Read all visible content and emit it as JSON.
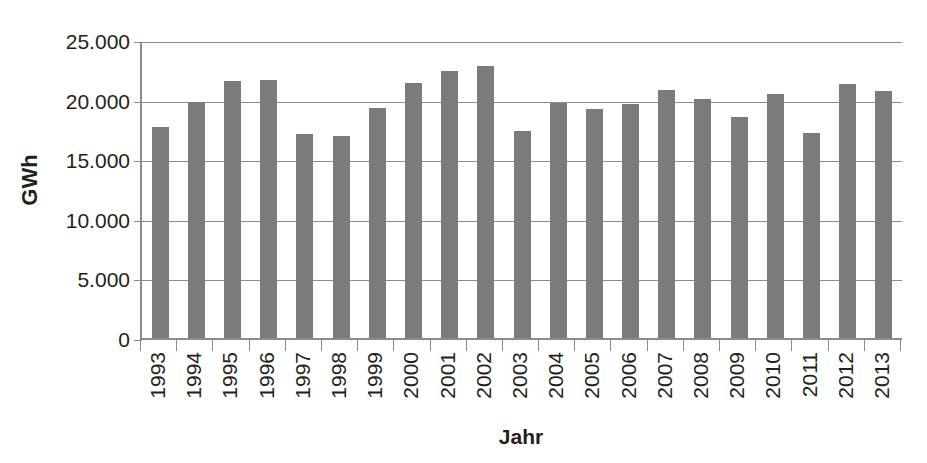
{
  "chart_data": {
    "type": "bar",
    "title": "",
    "subtitle": "",
    "xlabel": "Jahr",
    "ylabel": "GWh",
    "categories": [
      "1993",
      "1994",
      "1995",
      "1996",
      "1997",
      "1998",
      "1999",
      "2000",
      "2001",
      "2002",
      "2003",
      "2004",
      "2005",
      "2006",
      "2007",
      "2008",
      "2009",
      "2010",
      "2011",
      "2012",
      "2013"
    ],
    "values": [
      17850,
      20000,
      21700,
      21850,
      17250,
      17100,
      19500,
      21550,
      22600,
      22950,
      17550,
      19900,
      19400,
      19800,
      20950,
      20200,
      18700,
      20650,
      17350,
      21450,
      20850
    ],
    "series": [
      {
        "name": "GWh",
        "values": [
          17850,
          20000,
          21700,
          21850,
          17250,
          17100,
          19500,
          21550,
          22600,
          22950,
          17550,
          19900,
          19400,
          19800,
          20950,
          20200,
          18700,
          20650,
          17350,
          21450,
          20850
        ]
      }
    ],
    "ylim": [
      0,
      25000
    ],
    "ytick_values": [
      0,
      5000,
      10000,
      15000,
      20000,
      25000
    ],
    "ytick_labels": [
      "0",
      "5.000",
      "10.000",
      "15.000",
      "20.000",
      "25.000"
    ],
    "grid": true,
    "legend": false,
    "legend_position": "none",
    "bar_color": "#7b7b7b",
    "axis_color": "#8c8c8c",
    "text_color": "#231f20",
    "background_color": "#ffffff",
    "x_label_rotation": 90
  }
}
